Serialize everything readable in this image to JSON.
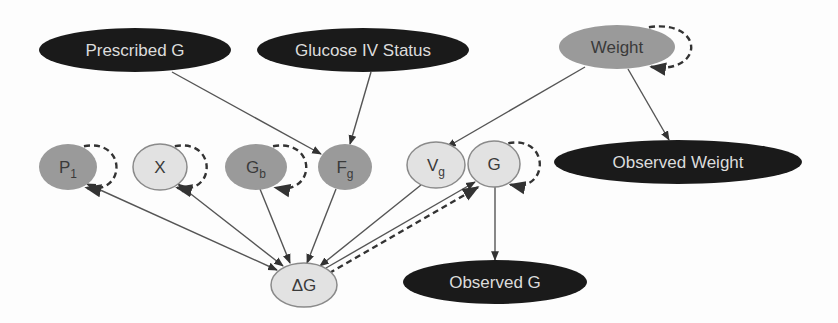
{
  "diagram": {
    "type": "dynamic-bayesian-network",
    "colors": {
      "observed_fill": "#1a1a1a",
      "observed_text": "#dcdcdc",
      "parameter_fill": "#9a9a9a",
      "latent_fill": "#e2e2e2",
      "node_text": "#3a3a3a",
      "edge": "#555555"
    },
    "nodes": [
      {
        "id": "prescribed_g",
        "label": "Prescribed G",
        "sub": "",
        "kind": "observed",
        "cx": 135,
        "cy": 50,
        "rx": 96,
        "ry": 22
      },
      {
        "id": "glucose_iv",
        "label": "Glucose IV Status",
        "sub": "",
        "kind": "observed",
        "cx": 363,
        "cy": 50,
        "rx": 106,
        "ry": 22
      },
      {
        "id": "weight",
        "label": "Weight",
        "sub": "",
        "kind": "parameter",
        "cx": 617,
        "cy": 47,
        "rx": 58,
        "ry": 22,
        "self_loop": true
      },
      {
        "id": "p1",
        "label": "P",
        "sub": "1",
        "kind": "parameter",
        "cx": 68,
        "cy": 167,
        "rx": 29,
        "ry": 23,
        "self_loop": true
      },
      {
        "id": "x",
        "label": "X",
        "sub": "",
        "kind": "latent",
        "cx": 160,
        "cy": 167,
        "rx": 27,
        "ry": 23,
        "self_loop": true
      },
      {
        "id": "gb",
        "label": "G",
        "sub": "b",
        "kind": "parameter",
        "cx": 256,
        "cy": 167,
        "rx": 31,
        "ry": 23,
        "self_loop": true
      },
      {
        "id": "fg",
        "label": "F",
        "sub": "g",
        "kind": "parameter",
        "cx": 345,
        "cy": 167,
        "rx": 27,
        "ry": 23,
        "self_loop": false
      },
      {
        "id": "vg",
        "label": "V",
        "sub": "g",
        "kind": "latent",
        "cx": 436,
        "cy": 165,
        "rx": 29,
        "ry": 23,
        "self_loop": false
      },
      {
        "id": "g",
        "label": "G",
        "sub": "",
        "kind": "latent",
        "cx": 494,
        "cy": 164,
        "rx": 26,
        "ry": 23,
        "self_loop": true
      },
      {
        "id": "delta_g",
        "label": "ΔG",
        "sub": "",
        "kind": "latent",
        "cx": 304,
        "cy": 285,
        "rx": 33,
        "ry": 22,
        "self_loop": false
      },
      {
        "id": "observed_weight",
        "label": "Observed Weight",
        "sub": "",
        "kind": "observed",
        "cx": 678,
        "cy": 162,
        "rx": 124,
        "ry": 22
      },
      {
        "id": "observed_g",
        "label": "Observed G",
        "sub": "",
        "kind": "observed",
        "cx": 495,
        "cy": 282,
        "rx": 92,
        "ry": 22
      }
    ],
    "edges": [
      {
        "from": "prescribed_g",
        "to": "fg",
        "style": "solid",
        "x1": 172,
        "y1": 72,
        "x2": 321,
        "y2": 154
      },
      {
        "from": "glucose_iv",
        "to": "fg",
        "style": "solid",
        "x1": 371,
        "y1": 72,
        "x2": 350,
        "y2": 144
      },
      {
        "from": "weight",
        "to": "vg",
        "style": "solid",
        "x1": 585,
        "y1": 67,
        "x2": 447,
        "y2": 147
      },
      {
        "from": "weight",
        "to": "observed_weight",
        "style": "solid",
        "x1": 628,
        "y1": 69,
        "x2": 669,
        "y2": 140
      },
      {
        "from": "p1",
        "to": "delta_g",
        "style": "solid-bidir",
        "x1": 87,
        "y1": 184,
        "x2": 277,
        "y2": 270
      },
      {
        "from": "x",
        "to": "delta_g",
        "style": "solid-bidir",
        "x1": 178,
        "y1": 184,
        "x2": 283,
        "y2": 266
      },
      {
        "from": "gb",
        "to": "delta_g",
        "style": "solid",
        "x1": 260,
        "y1": 189,
        "x2": 290,
        "y2": 263
      },
      {
        "from": "fg",
        "to": "delta_g",
        "style": "solid",
        "x1": 336,
        "y1": 189,
        "x2": 307,
        "y2": 263
      },
      {
        "from": "vg",
        "to": "delta_g",
        "style": "solid",
        "x1": 421,
        "y1": 185,
        "x2": 320,
        "y2": 266
      },
      {
        "from": "delta_g",
        "to": "g",
        "style": "solid-dashed",
        "x1": 326,
        "y1": 268,
        "x2": 475,
        "y2": 182
      },
      {
        "from": "g",
        "to": "observed_g",
        "style": "solid",
        "x1": 495,
        "y1": 187,
        "x2": 495,
        "y2": 260
      }
    ]
  }
}
